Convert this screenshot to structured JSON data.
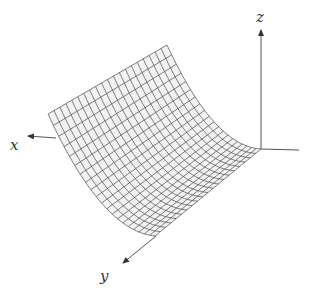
{
  "chart_data": {
    "type": "surface",
    "title": "",
    "equation": "z = x^2",
    "grid": {
      "u_cells": 20,
      "v_cells": 20
    },
    "axes": {
      "x": {
        "label": "x"
      },
      "y": {
        "label": "y"
      },
      "z": {
        "label": "z"
      }
    }
  },
  "labels": {
    "x": "x",
    "y": "y",
    "z": "z"
  },
  "colors": {
    "mesh": "#4a4a4a",
    "surface": "#f2f2f2",
    "axis": "#555555",
    "background": "#ffffff"
  }
}
